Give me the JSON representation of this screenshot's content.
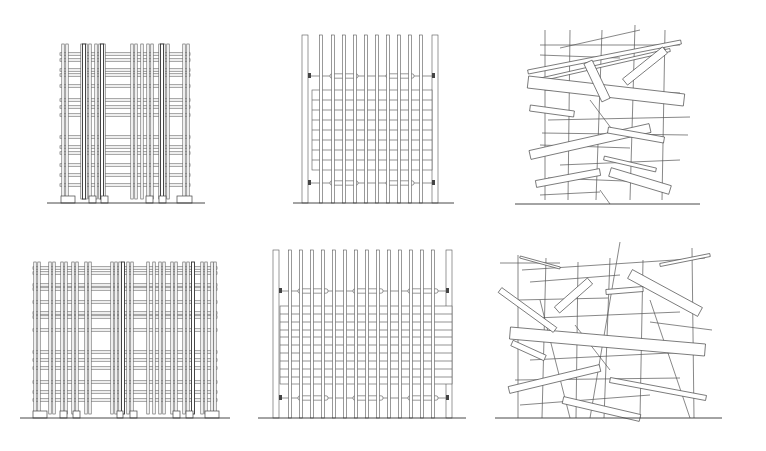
{
  "figure": {
    "background": "#ffffff",
    "line_color": "#444444",
    "panels": [
      {
        "id": "grid-tower-small",
        "row": 0,
        "col": 0,
        "type": "dense-grid",
        "x0": 62,
        "x1": 188,
        "top": 44,
        "ground": 203,
        "ground_x0": 47,
        "ground_x1": 205,
        "posts": [
          63,
          67,
          82,
          86,
          90,
          96,
          100,
          104,
          132,
          136,
          142,
          148,
          152,
          160,
          164,
          168,
          184,
          188
        ],
        "dark_posts": [
          84,
          102,
          162
        ],
        "beams": [
          54,
          60,
          70,
          75,
          86,
          100,
          107,
          115,
          137,
          147,
          153,
          165,
          175,
          185
        ],
        "footings": [
          [
            61,
            75
          ],
          [
            89,
            96
          ],
          [
            101,
            108
          ],
          [
            146,
            153
          ],
          [
            159,
            166
          ],
          [
            177,
            192
          ]
        ]
      },
      {
        "id": "slat-screen-small",
        "row": 0,
        "col": 1,
        "type": "slat-screen",
        "x0": 305,
        "x1": 435,
        "top": 35,
        "ground": 203,
        "ground_x0": 293,
        "ground_x1": 454,
        "frame_posts": [
          305,
          435
        ],
        "slats": [
          321,
          333,
          344,
          355,
          366,
          377,
          388,
          399,
          410,
          421
        ],
        "panel_top": 90,
        "panel_bottom": 170,
        "panel_x0": 312,
        "panel_x1": 432,
        "rails": [
          100,
          110,
          120,
          130,
          140,
          150,
          160
        ],
        "upper_band": 76,
        "lower_band": 183,
        "band_pads": [
          [
            330,
            358
          ],
          [
            386,
            414
          ]
        ]
      },
      {
        "id": "random-sticks-small",
        "row": 0,
        "col": 2,
        "type": "random-sticks",
        "x0": 520,
        "x1": 685,
        "ground": 204,
        "ground_x0": 515,
        "ground_x1": 700,
        "planks": [
          [
            528,
            72,
            681,
            42,
            4
          ],
          [
            530,
            82,
            670,
            50,
            3
          ],
          [
            528,
            82,
            684,
            100,
            12
          ],
          [
            530,
            108,
            574,
            114,
            6
          ],
          [
            530,
            155,
            650,
            128,
            9
          ],
          [
            536,
            184,
            600,
            172,
            7
          ],
          [
            610,
            172,
            670,
            190,
            9
          ],
          [
            588,
            62,
            606,
            100,
            9
          ],
          [
            625,
            82,
            665,
            50,
            8
          ],
          [
            608,
            130,
            664,
            140,
            6
          ],
          [
            604,
            158,
            656,
            170,
            4
          ]
        ],
        "sticks": [
          [
            545,
            30,
            545,
            200
          ],
          [
            570,
            30,
            568,
            200
          ],
          [
            602,
            30,
            596,
            200
          ],
          [
            635,
            25,
            630,
            200
          ],
          [
            665,
            30,
            662,
            200
          ],
          [
            540,
            45,
            680,
            45
          ],
          [
            540,
            55,
            620,
            58
          ],
          [
            545,
            90,
            680,
            93
          ],
          [
            548,
            120,
            690,
            117
          ],
          [
            542,
            133,
            688,
            135
          ],
          [
            540,
            145,
            630,
            148
          ],
          [
            560,
            165,
            680,
            160
          ],
          [
            548,
            178,
            650,
            182
          ],
          [
            590,
            100,
            620,
            140
          ],
          [
            560,
            48,
            640,
            30
          ],
          [
            540,
            195,
            600,
            192
          ],
          [
            600,
            190,
            610,
            204
          ]
        ]
      },
      {
        "id": "grid-tower-wide",
        "row": 1,
        "col": 0,
        "type": "dense-grid",
        "x0": 35,
        "x1": 215,
        "top": 262,
        "ground": 418,
        "ground_x0": 20,
        "ground_x1": 230,
        "posts": [
          35,
          39,
          50,
          54,
          62,
          66,
          73,
          77,
          86,
          90,
          112,
          116,
          120,
          128,
          132,
          148,
          154,
          160,
          164,
          172,
          176,
          184,
          188,
          202,
          206,
          212,
          215
        ],
        "dark_posts": [
          123,
          193
        ],
        "beams": [
          268,
          273,
          285,
          289,
          302,
          313,
          317,
          330,
          352,
          360,
          368,
          382,
          392,
          400
        ],
        "footings": [
          [
            33,
            47
          ],
          [
            60,
            67
          ],
          [
            73,
            80
          ],
          [
            117,
            123
          ],
          [
            130,
            137
          ],
          [
            173,
            180
          ],
          [
            186,
            193
          ],
          [
            205,
            219
          ]
        ]
      },
      {
        "id": "slat-screen-wide",
        "row": 1,
        "col": 1,
        "type": "slat-screen",
        "x0": 275,
        "x1": 449,
        "top": 250,
        "ground": 418,
        "ground_x0": 258,
        "ground_x1": 466,
        "frame_posts": [
          276,
          449
        ],
        "slats": [
          290,
          301,
          312,
          323,
          334,
          345,
          356,
          367,
          378,
          389,
          400,
          411,
          422,
          433
        ],
        "panel_top": 306,
        "panel_bottom": 384,
        "panel_x0": 280,
        "panel_x1": 452,
        "rails": [
          314,
          322,
          330,
          337,
          345,
          353,
          361,
          369,
          377
        ],
        "upper_band": 291,
        "lower_band": 398,
        "band_pads": [
          [
            298,
            328
          ],
          [
            353,
            383
          ],
          [
            408,
            438
          ]
        ]
      },
      {
        "id": "random-sticks-wide",
        "row": 1,
        "col": 2,
        "type": "random-sticks",
        "x0": 505,
        "x1": 712,
        "ground": 418,
        "ground_x0": 495,
        "ground_x1": 722,
        "planks": [
          [
            510,
            333,
            705,
            350,
            12
          ],
          [
            557,
            310,
            590,
            281,
            8
          ],
          [
            630,
            274,
            700,
            312,
            10
          ],
          [
            512,
            343,
            545,
            358,
            6
          ],
          [
            509,
            390,
            600,
            368,
            7
          ],
          [
            563,
            400,
            640,
            418,
            7
          ],
          [
            606,
            292,
            643,
            289,
            5
          ],
          [
            610,
            380,
            706,
            398,
            5
          ],
          [
            520,
            257,
            560,
            268,
            2
          ],
          [
            500,
            290,
            555,
            330,
            6
          ],
          [
            660,
            265,
            710,
            255,
            3
          ]
        ],
        "sticks": [
          [
            518,
            255,
            518,
            418
          ],
          [
            546,
            258,
            542,
            418
          ],
          [
            578,
            262,
            576,
            418
          ],
          [
            610,
            258,
            604,
            418
          ],
          [
            643,
            260,
            640,
            418
          ],
          [
            692,
            248,
            694,
            418
          ],
          [
            522,
            270,
            705,
            258
          ],
          [
            530,
            282,
            620,
            275
          ],
          [
            518,
            300,
            608,
            298
          ],
          [
            535,
            318,
            680,
            312
          ],
          [
            530,
            360,
            690,
            352
          ],
          [
            515,
            380,
            680,
            378
          ],
          [
            520,
            405,
            650,
            395
          ],
          [
            620,
            242,
            590,
            418
          ],
          [
            650,
            300,
            690,
            418
          ],
          [
            575,
            325,
            610,
            370
          ],
          [
            540,
            300,
            570,
            418
          ],
          [
            500,
            263,
            560,
            263
          ],
          [
            650,
            322,
            712,
            330
          ]
        ]
      }
    ]
  }
}
